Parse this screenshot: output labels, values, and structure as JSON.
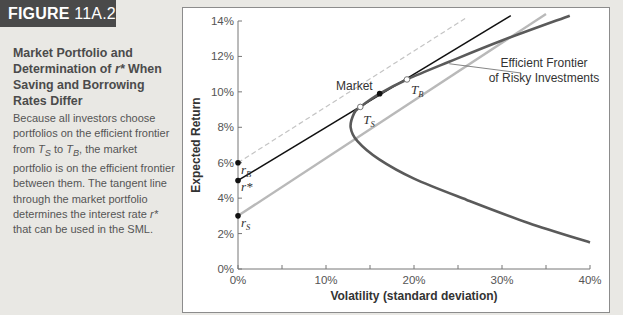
{
  "figure": {
    "tag": "FIGURE",
    "number": "11A.2",
    "title_parts": [
      "Market Portfolio and Determination of ",
      "r*",
      " When Saving and Borrowing Rates Differ"
    ],
    "body_parts": [
      "Because all investors choose portfolios on the efficient frontier from ",
      "T",
      "S",
      " to ",
      "T",
      "B",
      ", the market portfolio is on the efficient frontier between them. The tangent line through the market portfolio determines the interest rate ",
      "r*",
      " that can be used in the SML."
    ]
  },
  "colors": {
    "frontier": "#5a5a5a",
    "tangent_black": "#111111",
    "saving_line": "#b9b9b9",
    "borrowing_dashed": "#c4c4c4",
    "point": "#111111",
    "hollow_point_fill": "#b0b0b0"
  },
  "chart_data": {
    "type": "line",
    "title": "",
    "xlabel": "Volatility (standard deviation)",
    "ylabel": "Expected Return",
    "xlim": [
      0,
      40
    ],
    "ylim": [
      0,
      14
    ],
    "x_ticks": [
      0,
      10,
      20,
      30,
      40
    ],
    "x_minor_ticks": [
      5,
      15,
      25,
      35
    ],
    "x_tick_labels": [
      "0%",
      "10%",
      "20%",
      "30%",
      "40%"
    ],
    "y_ticks": [
      0,
      2,
      4,
      6,
      8,
      10,
      12,
      14
    ],
    "y_tick_labels": [
      "0%",
      "2%",
      "4%",
      "6%",
      "8%",
      "10%",
      "12%",
      "14%"
    ],
    "grid": false,
    "series": [
      {
        "name": "Efficient Frontier of Risky Investments",
        "style": "solid-thick-darkgray",
        "points": [
          [
            40,
            1.5
          ],
          [
            33,
            2.6
          ],
          [
            26,
            3.9
          ],
          [
            20,
            5.1
          ],
          [
            16,
            6.2
          ],
          [
            13.6,
            7.2
          ],
          [
            12.8,
            8.0
          ],
          [
            13.2,
            8.8
          ],
          [
            13.9,
            9.15
          ],
          [
            16.1,
            9.9
          ],
          [
            19.2,
            10.7
          ],
          [
            24,
            11.7
          ],
          [
            30,
            12.9
          ],
          [
            37.7,
            14.3
          ]
        ]
      },
      {
        "name": "Tangent line through market (r*)",
        "style": "solid-black",
        "points": [
          [
            0,
            5.0
          ],
          [
            31,
            14.3
          ]
        ]
      },
      {
        "name": "Saving line (r_S to T_S)",
        "style": "solid-lightgray",
        "points": [
          [
            0,
            3.0
          ],
          [
            35,
            14.4
          ]
        ]
      },
      {
        "name": "Borrowing line (r_B to T_B)",
        "style": "dashed-lightgray",
        "points": [
          [
            0,
            6.0
          ],
          [
            26,
            14.2
          ]
        ]
      }
    ],
    "marked_points": [
      {
        "label": "r",
        "sub": "B",
        "x": 0,
        "y": 6.0,
        "kind": "filled"
      },
      {
        "label": "r*",
        "sub": "",
        "x": 0,
        "y": 5.0,
        "kind": "filled"
      },
      {
        "label": "r",
        "sub": "S",
        "x": 0,
        "y": 3.0,
        "kind": "filled"
      },
      {
        "label": "Market",
        "sub": "",
        "x": 16.1,
        "y": 9.9,
        "kind": "filled"
      },
      {
        "label": "T",
        "sub": "S",
        "x": 13.9,
        "y": 9.15,
        "kind": "hollow"
      },
      {
        "label": "T",
        "sub": "B",
        "x": 19.2,
        "y": 10.7,
        "kind": "hollow"
      }
    ],
    "annotations": [
      {
        "text": [
          "Efficient Frontier",
          "of Risky Investments"
        ],
        "points_to": [
          24,
          11.7
        ]
      }
    ]
  }
}
